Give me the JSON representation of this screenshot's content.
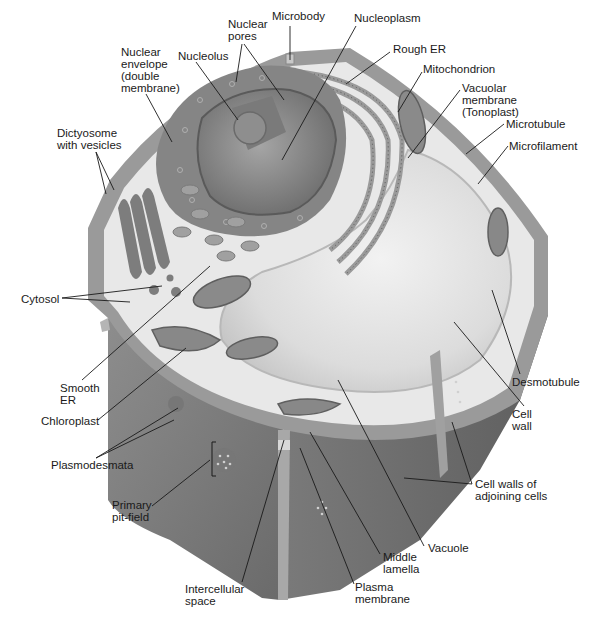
{
  "diagram": {
    "colors": {
      "background": "#ffffff",
      "cell_wall_dark": "#6e6e6e",
      "cell_wall_mid": "#8a8a8a",
      "cell_wall_light": "#a8a8a8",
      "cytoplasm": "#e6e6e6",
      "vacuole": "#d8d8d8",
      "nucleus": "#7d7d7d",
      "nucleoplasm": "#9a9a9a",
      "organelle": "#8c8c8c",
      "leader_line": "#1a1a1a",
      "label_text": "#1a1a1a"
    },
    "labels": [
      {
        "id": "nuclear-pores",
        "text": "Nuclear\npores",
        "x": 228,
        "y": 22
      },
      {
        "id": "microbody",
        "text": "Microbody",
        "x": 272,
        "y": 14
      },
      {
        "id": "nucleoplasm",
        "text": "Nucleoplasm",
        "x": 353,
        "y": 16
      },
      {
        "id": "nuclear-envelope",
        "text": "Nuclear\nenvelope\n(double\nmembrane)",
        "x": 121,
        "y": 47
      },
      {
        "id": "nucleolus",
        "text": "Nucleolus",
        "x": 178,
        "y": 49
      },
      {
        "id": "rough-er",
        "text": "Rough ER",
        "x": 393,
        "y": 43
      },
      {
        "id": "mitochondrion",
        "text": "Mitochondrion",
        "x": 423,
        "y": 62
      },
      {
        "id": "vacuolar-membrane",
        "text": "Vacuolar\nmembrane\n(Tonoplast)",
        "x": 462,
        "y": 82
      },
      {
        "id": "dictyosome",
        "text": "Dictyosome\nwith vesicles",
        "x": 57,
        "y": 127
      },
      {
        "id": "microtubule",
        "text": "Microtubule",
        "x": 506,
        "y": 118
      },
      {
        "id": "microfilament",
        "text": "Microfilament",
        "x": 509,
        "y": 140
      },
      {
        "id": "cytosol",
        "text": "Cytosol",
        "x": 21,
        "y": 292
      },
      {
        "id": "smooth-er",
        "text": "Smooth\nER",
        "x": 60,
        "y": 381
      },
      {
        "id": "desmotubule",
        "text": "Desmotubule",
        "x": 512,
        "y": 376
      },
      {
        "id": "chloroplast",
        "text": "Chloroplast",
        "x": 41,
        "y": 414
      },
      {
        "id": "cell-wall",
        "text": "Cell\nwall",
        "x": 512,
        "y": 409
      },
      {
        "id": "plasmodesmata",
        "text": "Plasmodesmata",
        "x": 51,
        "y": 458
      },
      {
        "id": "cell-walls-adjoining",
        "text": "Cell walls of\nadjoining cells",
        "x": 474,
        "y": 478
      },
      {
        "id": "primary-pit-field",
        "text": "Primary\npit-field",
        "x": 112,
        "y": 499
      },
      {
        "id": "vacuole",
        "text": "Vacuole",
        "x": 428,
        "y": 542
      },
      {
        "id": "middle-lamella",
        "text": "Middle\nlamella",
        "x": 382,
        "y": 551
      },
      {
        "id": "intercellular-space",
        "text": "Intercellular\nspace",
        "x": 185,
        "y": 582
      },
      {
        "id": "plasma-membrane",
        "text": "Plasma\nmembrane",
        "x": 355,
        "y": 580
      }
    ]
  }
}
